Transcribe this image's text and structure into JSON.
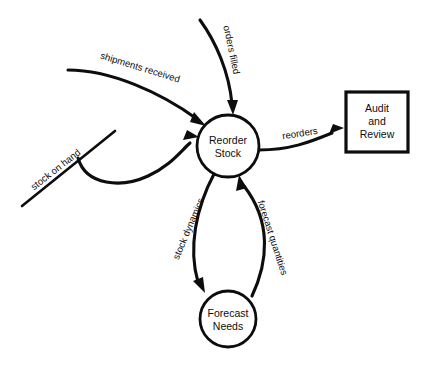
{
  "diagram": {
    "type": "data-flow-diagram",
    "title": "",
    "background_color": "#ffffff",
    "stroke_color": "#0d0d0d",
    "processes": [
      {
        "id": "reorder-stock",
        "label_line1": "Reorder",
        "label_line2": "Stock",
        "shape": "circle",
        "cx": 228,
        "cy": 146,
        "r": 31
      },
      {
        "id": "forecast-needs",
        "label_line1": "Forecast",
        "label_line2": "Needs",
        "shape": "circle",
        "cx": 228,
        "cy": 319,
        "r": 28
      }
    ],
    "entities": [
      {
        "id": "audit-and-review",
        "label_line1": "Audit",
        "label_line2": "and",
        "label_line3": "Review",
        "shape": "rectangle",
        "x": 346,
        "y": 92,
        "width": 62,
        "height": 60
      }
    ],
    "data_stores": [
      {
        "id": "stock-on-hand",
        "label": "stock on hand",
        "shape": "line"
      }
    ],
    "flows": [
      {
        "id": "shipments-received",
        "label": "shipments received",
        "from": "external",
        "to": "reorder-stock",
        "label_rotation": 17
      },
      {
        "id": "orders-filled",
        "label": "orders filled",
        "from": "external",
        "to": "reorder-stock",
        "label_rotation": 78
      },
      {
        "id": "stock-on-hand-flow",
        "label": "stock on hand",
        "from": "stock-on-hand",
        "to": "reorder-stock",
        "label_rotation": -38
      },
      {
        "id": "reorders",
        "label": "reorders",
        "from": "reorder-stock",
        "to": "audit-and-review",
        "label_rotation": -9
      },
      {
        "id": "stock-dynamics",
        "label": "stock dynamics",
        "from": "reorder-stock",
        "to": "forecast-needs",
        "label_rotation": -67
      },
      {
        "id": "forecast-quantities",
        "label": "forecast quantities",
        "from": "forecast-needs",
        "to": "reorder-stock",
        "label_rotation": 72
      }
    ]
  }
}
